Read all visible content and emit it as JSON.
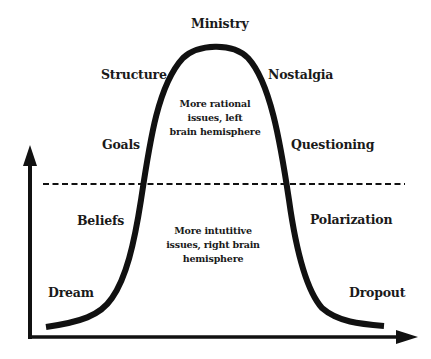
{
  "diagram": {
    "type": "bell-curve lifecycle diagram",
    "stages_rising": [
      "Dream",
      "Beliefs",
      "Goals",
      "Structure"
    ],
    "peak": "Ministry",
    "stages_falling": [
      "Nostalgia",
      "Questioning",
      "Polarization",
      "Dropout"
    ],
    "labels": {
      "ministry": "Ministry",
      "structure": "Structure",
      "nostalgia": "Nostalgia",
      "goals": "Goals",
      "questioning": "Questioning",
      "beliefs": "Beliefs",
      "polarization": "Polarization",
      "dream": "Dream",
      "dropout": "Dropout"
    },
    "upper_region_note": {
      "lines": [
        "More rational",
        "issues, left",
        "brain hemisphere"
      ]
    },
    "lower_region_note": {
      "lines": [
        "More intutitive",
        "issues, right brain",
        "hemisphere"
      ]
    },
    "divider": "dashed horizontal line",
    "axes": {
      "x_arrow": true,
      "y_arrow": true
    },
    "colors": {
      "line": "#111111",
      "background": "#ffffff"
    }
  }
}
